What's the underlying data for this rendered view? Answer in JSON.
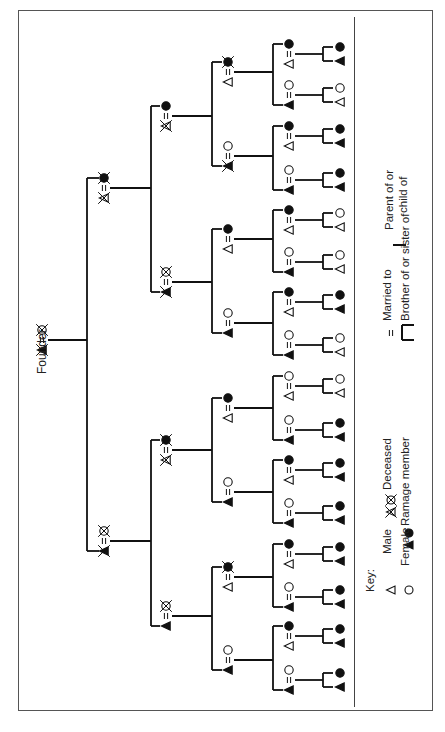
{
  "founder_label": "Founder",
  "key": {
    "heading": "Key:",
    "male": "Male",
    "female": "Female",
    "deceased": "Deceased",
    "ramage_member": "Ramage member",
    "married_to": "Married to",
    "sibling": "Brother of or sister of",
    "parent_line1": "Parent of or",
    "parent_line2": "child of"
  },
  "symbols": {
    "male": "triangle-open",
    "female": "circle-open",
    "male_member": "triangle-filled",
    "female_member": "circle-filled",
    "deceased": "cross-mark",
    "married": "="
  },
  "tree": {
    "founder": {
      "upper": "circle-open-deceased",
      "lower": "triangle-filled-deceased"
    },
    "generation1": [
      {
        "upper": "circle-filled-deceased",
        "lower": "triangle-open-deceased"
      },
      {
        "upper": "circle-open-deceased",
        "lower": "triangle-filled-deceased"
      }
    ],
    "generation2": [
      {
        "upper": "circle-filled",
        "lower": "triangle-open-deceased"
      },
      {
        "upper": "circle-open-deceased",
        "lower": "triangle-filled-deceased"
      },
      {
        "upper": "circle-filled-deceased",
        "lower": "triangle-open-deceased"
      },
      {
        "upper": "circle-open-deceased",
        "lower": "triangle-filled"
      }
    ],
    "generation3": [
      {
        "upper": "circle-filled-deceased",
        "lower": "triangle-open"
      },
      {
        "upper": "circle-open",
        "lower": "triangle-filled-deceased"
      },
      {
        "upper": "circle-filled",
        "lower": "triangle-open"
      },
      {
        "upper": "circle-open",
        "lower": "triangle-filled"
      },
      {
        "upper": "circle-filled",
        "lower": "triangle-open"
      },
      {
        "upper": "circle-open",
        "lower": "triangle-filled"
      },
      {
        "upper": "circle-filled-deceased",
        "lower": "triangle-open"
      },
      {
        "upper": "circle-open",
        "lower": "triangle-filled"
      }
    ],
    "generation4": [
      {
        "upper": "circle-filled",
        "lower": "triangle-open"
      },
      {
        "upper": "circle-open",
        "lower": "triangle-filled"
      },
      {
        "upper": "circle-filled",
        "lower": "triangle-open"
      },
      {
        "upper": "circle-open",
        "lower": "triangle-filled"
      },
      {
        "upper": "circle-filled",
        "lower": "triangle-open"
      },
      {
        "upper": "circle-open",
        "lower": "triangle-filled"
      },
      {
        "upper": "circle-filled",
        "lower": "triangle-open"
      },
      {
        "upper": "circle-open",
        "lower": "triangle-filled"
      },
      {
        "upper": "circle-open",
        "lower": "triangle-open"
      },
      {
        "upper": "circle-open",
        "lower": "triangle-filled"
      },
      {
        "upper": "circle-filled",
        "lower": "triangle-open"
      },
      {
        "upper": "circle-open",
        "lower": "triangle-filled"
      },
      {
        "upper": "circle-filled",
        "lower": "triangle-open"
      },
      {
        "upper": "circle-open",
        "lower": "triangle-filled"
      },
      {
        "upper": "circle-filled",
        "lower": "triangle-open"
      },
      {
        "upper": "circle-open",
        "lower": "triangle-filled"
      }
    ],
    "generation5_siblings": [
      {
        "upper": "circle-filled",
        "lower": "triangle-filled"
      },
      {
        "upper": "circle-open",
        "lower": "triangle-open"
      },
      {
        "upper": "circle-filled",
        "lower": "triangle-filled"
      },
      {
        "upper": "circle-filled",
        "lower": "triangle-filled"
      },
      {
        "upper": "circle-open",
        "lower": "triangle-open"
      },
      {
        "upper": "circle-open",
        "lower": "triangle-open"
      },
      {
        "upper": "circle-filled",
        "lower": "triangle-filled"
      },
      {
        "upper": "circle-open",
        "lower": "triangle-open"
      },
      {
        "upper": "circle-open",
        "lower": "triangle-open"
      },
      {
        "upper": "circle-filled",
        "lower": "triangle-filled"
      },
      {
        "upper": "circle-filled",
        "lower": "triangle-filled"
      },
      {
        "upper": "circle-filled",
        "lower": "triangle-filled"
      },
      {
        "upper": "circle-filled",
        "lower": "triangle-filled"
      },
      {
        "upper": "circle-filled",
        "lower": "triangle-filled"
      },
      {
        "upper": "circle-filled",
        "lower": "triangle-filled"
      },
      {
        "upper": "circle-filled",
        "lower": "triangle-filled"
      }
    ]
  }
}
